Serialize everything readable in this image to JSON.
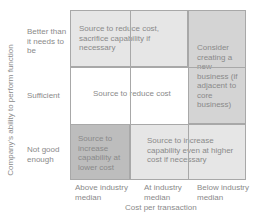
{
  "y_axis": {
    "label": "Company's ability to perform function",
    "rows": [
      "Better than it needs to be",
      "Sufficient",
      "Not good enough"
    ]
  },
  "x_axis": {
    "label": "Cost per transaction",
    "columns": [
      "Above industry median",
      "At industry median",
      "Below industry median"
    ]
  },
  "cells": {
    "top_span": "Source to reduce cost, sacrifice capability if necessary",
    "middle_span": "Source to reduce cost",
    "right_span": "Consider creating a new business (if adjacent to core business)",
    "bottom_left": "Source to increase capability at lower cost",
    "bottom_span": "Source to increase capability even at higher cost if necessary"
  },
  "colors": {
    "light_gray": "#e6e6e6",
    "mid_gray": "#d4d4d4",
    "dark_gray": "#bdbdbd",
    "white": "#ffffff",
    "grid_line": "#a8a8a8",
    "text": "#8a8a8a"
  }
}
